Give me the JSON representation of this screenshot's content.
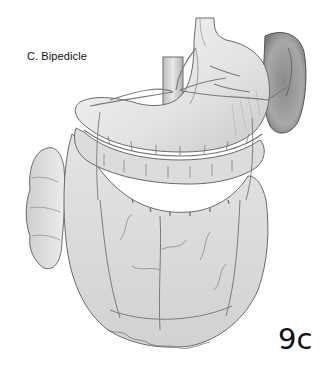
{
  "figure": {
    "title": "C. Bipedicle",
    "figure_number": "9c",
    "structures": [
      "esophagus",
      "stomach",
      "spleen",
      "aorta",
      "transverse-colon",
      "greater-omentum",
      "gastroepiploic-arcade",
      "ascending-colon"
    ],
    "palette": {
      "background": "#ffffff",
      "organ_fill": "#e6e6e6",
      "organ_light": "#f2f2f2",
      "omentum_fill": "#d9d9d9",
      "spleen_fill": "#9a9a9a",
      "outline": "#6a6a6a",
      "vessel": "#7c7c7c",
      "text": "#111111"
    }
  }
}
